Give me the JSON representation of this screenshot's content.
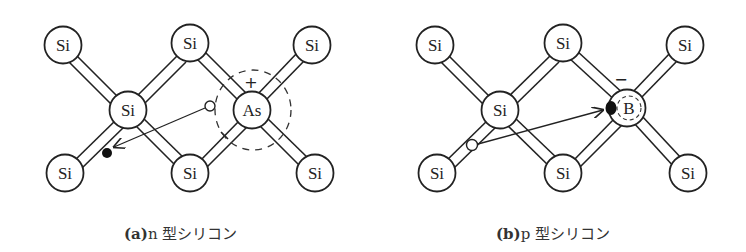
{
  "panels": [
    {
      "id": "a",
      "caption_prefix": "(a)",
      "caption_text": "n 型シリコン",
      "atoms": [
        {
          "label": "Si",
          "cx": 63,
          "cy": 45
        },
        {
          "label": "Si",
          "cx": 190,
          "cy": 43
        },
        {
          "label": "Si",
          "cx": 312,
          "cy": 45
        },
        {
          "label": "Si",
          "cx": 128,
          "cy": 110
        },
        {
          "label": "As",
          "cx": 252,
          "cy": 110
        },
        {
          "label": "Si",
          "cx": 65,
          "cy": 173
        },
        {
          "label": "Si",
          "cx": 190,
          "cy": 173
        },
        {
          "label": "Si",
          "cx": 315,
          "cy": 173
        }
      ],
      "dopant": "As",
      "dopant_charge": "+",
      "carrier": "electron",
      "description": "Free electron leaves As donor, leaving positive ion"
    },
    {
      "id": "b",
      "caption_prefix": "(b)",
      "caption_text": "p 型シリコン",
      "atoms": [
        {
          "label": "Si",
          "cx": 435,
          "cy": 45
        },
        {
          "label": "Si",
          "cx": 563,
          "cy": 43
        },
        {
          "label": "Si",
          "cx": 685,
          "cy": 45
        },
        {
          "label": "Si",
          "cx": 500,
          "cy": 110
        },
        {
          "label": "B",
          "cx": 627,
          "cy": 108
        },
        {
          "label": "Si",
          "cx": 437,
          "cy": 173
        },
        {
          "label": "Si",
          "cx": 563,
          "cy": 173
        },
        {
          "label": "Si",
          "cx": 688,
          "cy": 173
        }
      ],
      "dopant": "B",
      "dopant_charge": "−",
      "carrier": "hole",
      "description": "Electron moves to B acceptor, hole created in bond"
    }
  ],
  "labels": {
    "a": {
      "si1": "Si",
      "si2": "Si",
      "si3": "Si",
      "si4": "Si",
      "dop": "As",
      "si5": "Si",
      "si6": "Si",
      "si7": "Si",
      "charge": "+"
    },
    "b": {
      "si1": "Si",
      "si2": "Si",
      "si3": "Si",
      "si4": "Si",
      "dop": "B",
      "si5": "Si",
      "si6": "Si",
      "si7": "Si",
      "charge": "−"
    }
  }
}
